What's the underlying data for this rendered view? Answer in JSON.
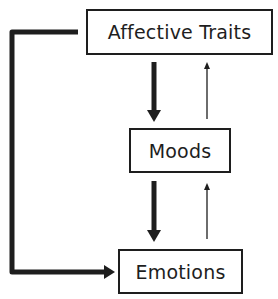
{
  "diagram": {
    "nodes": [
      {
        "id": "affective-traits",
        "label": "Affective Traits"
      },
      {
        "id": "moods",
        "label": "Moods"
      },
      {
        "id": "emotions",
        "label": "Emotions"
      }
    ],
    "edges": [
      {
        "from": "affective-traits",
        "to": "moods",
        "style": "thick"
      },
      {
        "from": "moods",
        "to": "affective-traits",
        "style": "thin"
      },
      {
        "from": "moods",
        "to": "emotions",
        "style": "thick"
      },
      {
        "from": "emotions",
        "to": "moods",
        "style": "thin"
      },
      {
        "from": "affective-traits",
        "to": "emotions",
        "style": "thick",
        "route": "left-bypass"
      }
    ],
    "colors": {
      "stroke": "#1e1e1e",
      "background": "#ffffff"
    }
  }
}
